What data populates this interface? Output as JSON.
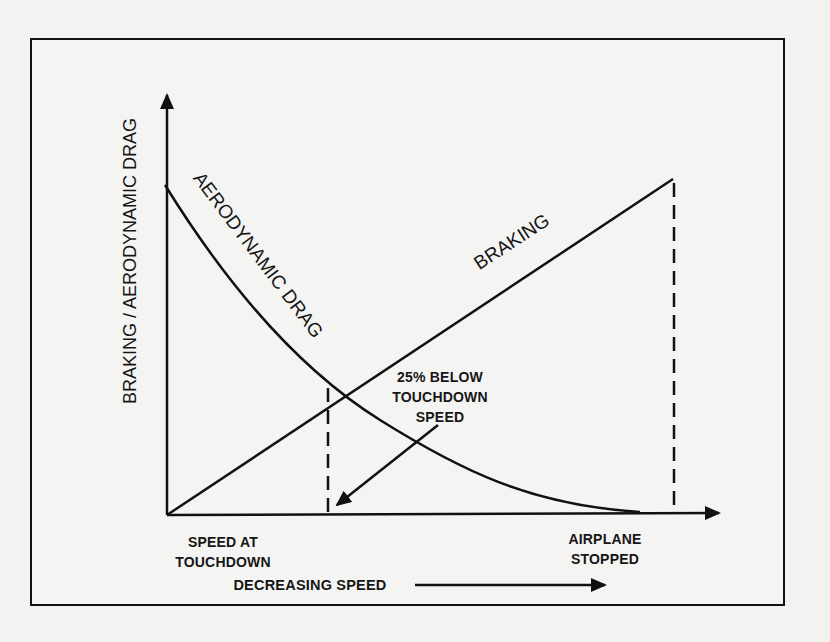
{
  "diagram": {
    "y_axis_label": "BRAKING / AERODYNAMIC DRAG",
    "curve_labels": {
      "aerodynamic_drag": "AERODYNAMIC DRAG",
      "braking": "BRAKING"
    },
    "annotations": {
      "crossover": [
        "25% BELOW",
        "TOUCHDOWN",
        "SPEED"
      ],
      "speed_at_touchdown": [
        "SPEED AT",
        "TOUCHDOWN"
      ],
      "airplane_stopped": [
        "AIRPLANE",
        "STOPPED"
      ],
      "x_direction": "DECREASING SPEED"
    },
    "colors": {
      "ink": "#111111",
      "paper": "#f4f4f2"
    }
  }
}
